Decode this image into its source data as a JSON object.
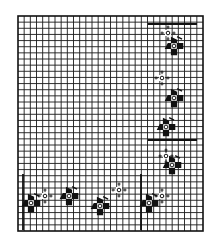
{
  "diagram": {
    "type": "cross-stitch-chart",
    "background": "#ffffff",
    "ink": "#111111",
    "grid": {
      "x": 18,
      "y": 16,
      "width": 185,
      "height": 215,
      "cols": 30,
      "rows": 35,
      "line_color": "#1a1a1a",
      "border_color": "#111111"
    },
    "guide_lines": [
      {
        "x1": 148,
        "y1": 24,
        "x2": 197,
        "y2": 24
      },
      {
        "x1": 148,
        "y1": 140,
        "x2": 197,
        "y2": 140
      },
      {
        "x1": 23,
        "y1": 174,
        "x2": 23,
        "y2": 230
      },
      {
        "x1": 141,
        "y1": 174,
        "x2": 141,
        "y2": 230
      }
    ],
    "dark_motifs": [
      {
        "cx": 174,
        "cy": 46
      },
      {
        "cx": 174,
        "cy": 98
      },
      {
        "cx": 166,
        "cy": 127
      },
      {
        "cx": 172,
        "cy": 165
      },
      {
        "cx": 31,
        "cy": 203
      },
      {
        "cx": 69,
        "cy": 196
      },
      {
        "cx": 100,
        "cy": 206
      },
      {
        "cx": 149,
        "cy": 203
      }
    ],
    "light_motifs": [
      {
        "cx": 168,
        "cy": 33
      },
      {
        "cx": 162,
        "cy": 78
      },
      {
        "cx": 166,
        "cy": 156
      },
      {
        "cx": 45,
        "cy": 196
      },
      {
        "cx": 119,
        "cy": 190
      },
      {
        "cx": 162,
        "cy": 196
      }
    ]
  }
}
